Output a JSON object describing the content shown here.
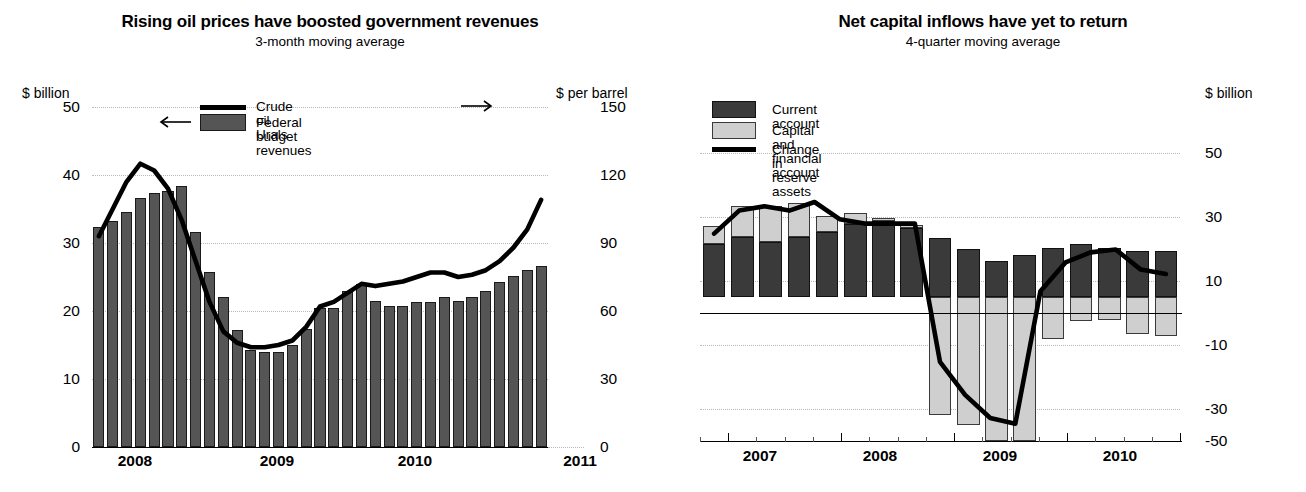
{
  "chart_data": [
    {
      "id": "left",
      "type": "bar",
      "title": "Rising oil prices have boosted government revenues",
      "subtitle": "3-month moving average",
      "ylabel_left": "$ billion",
      "ylabel_right": "$ per barrel",
      "ylim_left": [
        0,
        50
      ],
      "ylim_right": [
        0,
        150
      ],
      "yticks_left": [
        "0",
        "10",
        "20",
        "30",
        "40",
        "50"
      ],
      "yticks_right": [
        "0",
        "30",
        "60",
        "90",
        "120",
        "150"
      ],
      "xlabels": [
        "2008",
        "2009",
        "2010",
        "2011"
      ],
      "grid": true,
      "legend_position": "top-center",
      "legend": [
        {
          "label": "Crude oil Urals",
          "marker": "line",
          "color": "#000000",
          "axis_arrow": "right"
        },
        {
          "label": "Federal budget revenues",
          "marker": "bar",
          "color": "#555555",
          "axis_arrow": "left"
        }
      ],
      "series": [
        {
          "name": "Federal budget revenues",
          "unit": "$ billion",
          "axis": "left",
          "type": "bar",
          "values": [
            32.4,
            33.3,
            34.6,
            36.6,
            37.4,
            37.6,
            38.4,
            31.6,
            25.8,
            22.0,
            17.2,
            14.2,
            14.0,
            14.0,
            15.0,
            17.4,
            20.5,
            20.4,
            23.0,
            24.0,
            21.5,
            20.7,
            20.7,
            21.3,
            21.3,
            22.0,
            21.5,
            22.0,
            23.0,
            24.3,
            25.2,
            26.0,
            26.6
          ]
        },
        {
          "name": "Crude oil Urals",
          "unit": "$ per barrel",
          "axis": "right",
          "type": "line",
          "values": [
            93,
            105,
            117,
            125,
            122,
            114,
            100,
            82,
            64,
            51,
            46,
            44,
            44,
            45,
            47,
            53,
            62,
            64,
            68,
            72,
            71,
            72,
            73,
            75,
            77,
            77,
            75,
            76,
            78,
            82,
            88,
            96,
            109
          ]
        }
      ]
    },
    {
      "id": "right",
      "type": "bar",
      "title": "Net capital inflows have yet to return",
      "subtitle": "4-quarter moving average",
      "ylabel_right": "$ billion",
      "ylim": [
        -50,
        50
      ],
      "yticks": [
        "-50",
        "-30",
        "-10",
        "10",
        "30",
        "50"
      ],
      "xlabels": [
        "2007",
        "2008",
        "2009",
        "2010"
      ],
      "grid": true,
      "legend_position": "top-left",
      "legend": [
        {
          "label": "Current account",
          "marker": "bar",
          "color": "#3a3a3a"
        },
        {
          "label": "Capital and financial account",
          "marker": "bar",
          "color": "#cfcfcf"
        },
        {
          "label": "Change in reserve assets",
          "marker": "line",
          "color": "#000000"
        }
      ],
      "categories": [
        "2006Q4",
        "2007Q1",
        "2007Q2",
        "2007Q3",
        "2007Q4",
        "2008Q1",
        "2008Q2",
        "2008Q3",
        "2008Q4",
        "2009Q1",
        "2009Q2",
        "2009Q3",
        "2009Q4",
        "2010Q1",
        "2010Q2",
        "2010Q3",
        "2010Q4"
      ],
      "series": [
        {
          "name": "Current account",
          "type": "bar-stacked",
          "values": [
            18.5,
            21.0,
            19.0,
            21.0,
            22.5,
            25.5,
            26.5,
            24.0,
            20.5,
            16.5,
            12.5,
            14.5,
            17.0,
            18.5,
            17.0,
            16.0,
            16.0
          ]
        },
        {
          "name": "Capital and financial account",
          "type": "bar-stacked",
          "values": [
            6.0,
            10.5,
            12.5,
            11.5,
            5.5,
            3.5,
            1.0,
            1.0,
            -41.0,
            -44.5,
            -50.0,
            -50.0,
            -14.5,
            -8.5,
            -8.0,
            -13.0,
            -13.5
          ]
        },
        {
          "name": "Change in reserve assets",
          "type": "line",
          "values": [
            22.0,
            30.0,
            31.5,
            30.0,
            33.0,
            27.0,
            25.5,
            25.5,
            25.5,
            -22.5,
            -34.0,
            -42.0,
            -44.0,
            2.0,
            12.0,
            15.5,
            16.5,
            9.5,
            8.0
          ]
        }
      ]
    }
  ]
}
